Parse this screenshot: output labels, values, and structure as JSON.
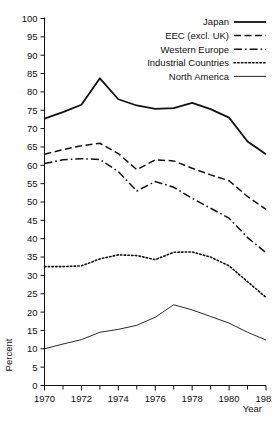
{
  "chart_data": {
    "type": "line",
    "title": "",
    "xlabel": "Year",
    "ylabel": "Percent",
    "xlim": [
      1970,
      1982
    ],
    "ylim": [
      0,
      100
    ],
    "ytick_step": 5,
    "xtick_step": 2,
    "xminor_step": 1,
    "grid": false,
    "legend_position": "top-right",
    "yticks": [
      0,
      5,
      10,
      15,
      20,
      25,
      30,
      35,
      40,
      45,
      50,
      55,
      60,
      65,
      70,
      75,
      80,
      85,
      90,
      95,
      100
    ],
    "ytick_labels": [
      "0",
      "5",
      "10",
      "15",
      "20",
      "25",
      "30",
      "35",
      "40",
      "45",
      "50",
      "55",
      "60",
      "65",
      "70",
      "75",
      "80",
      "85",
      "90",
      "95",
      "100"
    ],
    "xticks": [
      1970,
      1972,
      1974,
      1976,
      1978,
      1980,
      1982
    ],
    "xtick_labels": [
      "1970",
      "1972",
      "1974",
      "1976",
      "1978",
      "1980",
      "1982"
    ],
    "x": [
      1970,
      1971,
      1972,
      1973,
      1974,
      1975,
      1976,
      1977,
      1978,
      1979,
      1980,
      1981,
      1982
    ],
    "series": [
      {
        "name": "Japan",
        "style": "solid",
        "color": "#111111",
        "width": 1.8,
        "values": [
          72.7,
          74.5,
          76.5,
          83.7,
          78.0,
          76.3,
          75.4,
          75.6,
          77.0,
          75.3,
          73.0,
          66.5,
          63.0
        ]
      },
      {
        "name": "EEC (excl. UK)",
        "style": "dashed",
        "color": "#111111",
        "width": 1.5,
        "values": [
          63.0,
          64.3,
          65.3,
          66.0,
          63.2,
          58.8,
          61.5,
          61.2,
          59.2,
          57.4,
          55.8,
          51.5,
          48.0
        ]
      },
      {
        "name": "Western Europe",
        "style": "dashdot",
        "color": "#111111",
        "width": 1.5,
        "values": [
          60.5,
          61.5,
          61.8,
          61.6,
          58.3,
          53.0,
          55.6,
          54.0,
          51.0,
          48.3,
          45.6,
          40.3,
          36.2
        ]
      },
      {
        "name": "Industrial Countries",
        "style": "dotted",
        "color": "#111111",
        "width": 1.6,
        "values": [
          32.4,
          32.4,
          32.6,
          34.5,
          35.6,
          35.4,
          34.3,
          36.3,
          36.4,
          35.0,
          32.6,
          28.3,
          24.0
        ]
      },
      {
        "name": "North America",
        "style": "solid-thin",
        "color": "#111111",
        "width": 0.9,
        "values": [
          10.0,
          11.3,
          12.5,
          14.5,
          15.3,
          16.4,
          18.6,
          22.0,
          20.6,
          18.8,
          17.0,
          14.5,
          12.4
        ]
      }
    ]
  },
  "legend": {
    "items": [
      {
        "label": "Japan",
        "style": "solid"
      },
      {
        "label": "EEC (excl. UK)",
        "style": "dashed"
      },
      {
        "label": "Western Europe",
        "style": "dashdot"
      },
      {
        "label": "Industrial Countries",
        "style": "dotted"
      },
      {
        "label": "North America",
        "style": "solid-thin"
      }
    ]
  },
  "axes": {
    "y_title": "Percent",
    "x_title": "Year"
  }
}
